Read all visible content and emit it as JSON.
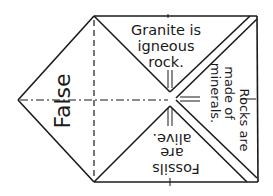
{
  "diagram": {
    "type": "paper fortune teller fold",
    "panels": {
      "left": {
        "label": "False",
        "rotation": -90
      },
      "top": {
        "lines": [
          "Granite is",
          "igneous",
          "rock."
        ]
      },
      "right": {
        "lines": [
          "Rocks are",
          "made of",
          "minerals."
        ],
        "rotation": 90
      },
      "bottom": {
        "lines": [
          "Fossils",
          "are",
          "alive."
        ],
        "rotation": 180
      }
    },
    "colors": {
      "line": "#1a1a1a",
      "background": "#ffffff"
    }
  }
}
